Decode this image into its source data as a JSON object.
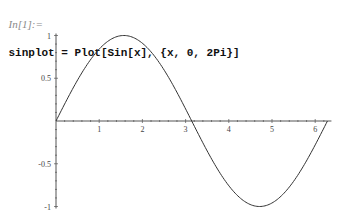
{
  "notebook": {
    "prompt": "In[1]:=",
    "code": "sinplot = Plot[Sin[x], {x, 0, 2Pi}]"
  },
  "colors": {
    "axis": "#555555",
    "curve": "#333333",
    "prompt": "#8a8a8a",
    "code": "#111111"
  },
  "chart_data": {
    "type": "line",
    "title": "",
    "xlabel": "",
    "ylabel": "",
    "function": "Sin[x]",
    "xlim": [
      0,
      6.2832
    ],
    "ylim": [
      -1,
      1
    ],
    "grid": false,
    "legend": null,
    "x_ticks": [
      1,
      2,
      3,
      4,
      5,
      6
    ],
    "x_tick_labels": [
      "1",
      "2",
      "3",
      "4",
      "5",
      "6"
    ],
    "y_ticks": [
      -1,
      -0.5,
      0.5,
      1
    ],
    "y_tick_labels": [
      "-1",
      "-0.5",
      "0.5",
      "1"
    ],
    "series": [
      {
        "name": "Sin[x]",
        "x": [
          0,
          0.5236,
          1.0472,
          1.5708,
          2.0944,
          2.618,
          3.1416,
          3.6652,
          4.1888,
          4.7124,
          5.236,
          5.7596,
          6.2832
        ],
        "values": [
          0,
          0.5,
          0.866,
          1,
          0.866,
          0.5,
          0,
          -0.5,
          -0.866,
          -1,
          -0.866,
          -0.5,
          0
        ]
      }
    ]
  },
  "layout": {
    "origin_x": 56,
    "origin_y": 121,
    "px_per_x": 43.2,
    "px_per_y": 85.5
  }
}
